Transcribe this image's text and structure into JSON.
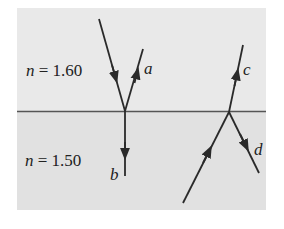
{
  "diagram": {
    "colors": {
      "background": "#e6e6e6",
      "upper_medium": "#e9e9e9",
      "lower_medium": "#e2e2e2",
      "ray": "#2a2a2a",
      "interface": "#555555"
    },
    "media": {
      "upper": {
        "label": "n = 1.60",
        "n_symbol": "n",
        "value": "= 1.60"
      },
      "lower": {
        "label": "n = 1.50",
        "n_symbol": "n",
        "value": "= 1.50"
      }
    },
    "rays": {
      "a": "a",
      "b": "b",
      "c": "c",
      "d": "d"
    }
  }
}
